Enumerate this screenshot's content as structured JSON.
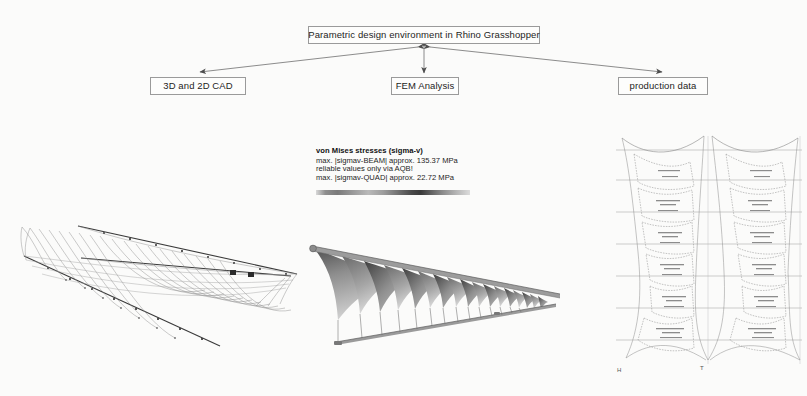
{
  "diagram": {
    "top_box": "Parametric design environment in Rhino Grasshopper",
    "left_box": "3D and 2D CAD",
    "middle_box": "FEM Analysis",
    "right_box": "production data",
    "arrows": [
      {
        "name": "top-to-cad",
        "type": "bidirectional"
      },
      {
        "name": "top-to-fem",
        "type": "bidirectional"
      },
      {
        "name": "top-to-production",
        "type": "bidirectional"
      }
    ]
  },
  "legend": {
    "title": "von Mises stresses (sigma-v)",
    "line1": "max. |sigmav-BEAM| approx. 135.37 MPa",
    "line2": "reliable values only via AQB!",
    "line3": "max. |sigmav-QUAD| approx. 22.72 MPa",
    "colorbar": "grayscale-stress-gradient"
  },
  "figures": {
    "cad": {
      "caption": "3D wireframe CAD model of tensile membrane canopy"
    },
    "fem": {
      "caption": "FEM von Mises stress render of membrane canopy"
    },
    "production": {
      "caption": "Cutting pattern production drawing of membrane panels"
    }
  },
  "markers": {
    "h": "H",
    "t": "T"
  },
  "colors": {
    "background": "#fbfbfa",
    "line": "#6f6f6f",
    "box_border": "#9a9a9a",
    "text": "#1b1b1b"
  }
}
